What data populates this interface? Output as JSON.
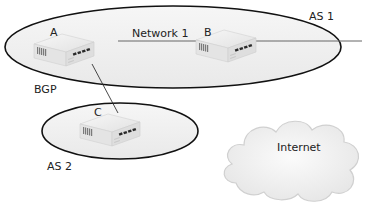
{
  "diagram": {
    "autonomous_systems": [
      {
        "id": "as1",
        "label": "AS 1"
      },
      {
        "id": "as2",
        "label": "AS 2"
      }
    ],
    "network_label": "Network 1",
    "protocol_label": "BGP",
    "routers": [
      {
        "id": "A",
        "label": "A"
      },
      {
        "id": "B",
        "label": "B"
      },
      {
        "id": "C",
        "label": "C"
      }
    ],
    "cloud_label": "Internet",
    "colors": {
      "ellipse_fill": "#efefef",
      "ellipse_stroke": "#111111",
      "line": "#555555",
      "router_body": "#e8e8e8",
      "cloud_fill": "#f3f3f3"
    }
  }
}
